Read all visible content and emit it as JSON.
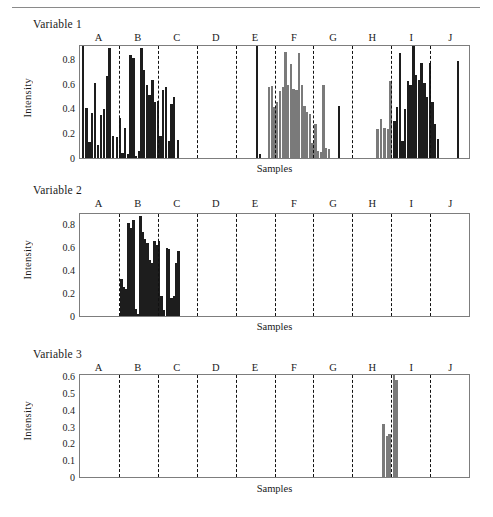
{
  "figure": {
    "title_rule": true,
    "panels": [
      {
        "title": "Variable 1"
      },
      {
        "title": "Variable 2"
      },
      {
        "title": "Variable 3"
      }
    ]
  },
  "chart_data": [
    {
      "type": "bar",
      "title": "Variable 1",
      "xlabel": "Samples",
      "ylabel": "Intensity",
      "ylim": [
        0,
        0.92
      ],
      "yticks": [
        0,
        0.2,
        0.4,
        0.6,
        0.8
      ],
      "ytick_labels": [
        "0",
        "0.2",
        "0.4",
        "0.6",
        "0.8"
      ],
      "grid": false,
      "legend": "none",
      "categories": [
        "A",
        "B",
        "C",
        "D",
        "E",
        "F",
        "G",
        "H",
        "I",
        "J"
      ],
      "group_boundaries": [
        0.1,
        0.2,
        0.3,
        0.4,
        0.5,
        0.6,
        0.7,
        0.8,
        0.9
      ],
      "bar_color_dark": "#1d1d1d",
      "bar_color_gray": "#7a7a7a",
      "bars": [
        {
          "x": 0.004,
          "h": 0.92,
          "c": "dark"
        },
        {
          "x": 0.014,
          "h": 0.41,
          "c": "dark"
        },
        {
          "x": 0.021,
          "h": 0.13,
          "c": "dark"
        },
        {
          "x": 0.028,
          "h": 0.37,
          "c": "dark"
        },
        {
          "x": 0.036,
          "h": 0.62,
          "c": "dark"
        },
        {
          "x": 0.043,
          "h": 0.11,
          "c": "dark"
        },
        {
          "x": 0.051,
          "h": 0.35,
          "c": "dark"
        },
        {
          "x": 0.058,
          "h": 0.4,
          "c": "dark"
        },
        {
          "x": 0.066,
          "h": 0.67,
          "c": "dark"
        },
        {
          "x": 0.073,
          "h": 0.9,
          "c": "dark"
        },
        {
          "x": 0.082,
          "h": 0.18,
          "c": "dark"
        },
        {
          "x": 0.092,
          "h": 0.17,
          "c": "dark"
        },
        {
          "x": 0.099,
          "h": 0.33,
          "c": "dark"
        },
        {
          "x": 0.106,
          "h": 0.04,
          "c": "dark"
        },
        {
          "x": 0.113,
          "h": 0.25,
          "c": "dark"
        },
        {
          "x": 0.12,
          "h": 0.03,
          "c": "dark"
        },
        {
          "x": 0.127,
          "h": 0.85,
          "c": "dark"
        },
        {
          "x": 0.134,
          "h": 0.82,
          "c": "dark"
        },
        {
          "x": 0.141,
          "h": 0.02,
          "c": "dark"
        },
        {
          "x": 0.148,
          "h": 0.06,
          "c": "dark"
        },
        {
          "x": 0.155,
          "h": 0.9,
          "c": "dark"
        },
        {
          "x": 0.162,
          "h": 0.72,
          "c": "dark"
        },
        {
          "x": 0.169,
          "h": 0.6,
          "c": "dark"
        },
        {
          "x": 0.176,
          "h": 0.52,
          "c": "dark"
        },
        {
          "x": 0.183,
          "h": 0.64,
          "c": "dark"
        },
        {
          "x": 0.19,
          "h": 0.46,
          "c": "dark"
        },
        {
          "x": 0.197,
          "h": 0.47,
          "c": "dark"
        },
        {
          "x": 0.204,
          "h": 0.18,
          "c": "dark"
        },
        {
          "x": 0.211,
          "h": 0.56,
          "c": "dark"
        },
        {
          "x": 0.218,
          "h": 0.58,
          "c": "dark"
        },
        {
          "x": 0.225,
          "h": 0.14,
          "c": "dark"
        },
        {
          "x": 0.232,
          "h": 0.44,
          "c": "dark"
        },
        {
          "x": 0.239,
          "h": 0.5,
          "c": "dark"
        },
        {
          "x": 0.249,
          "h": 0.15,
          "c": "dark"
        },
        {
          "x": 0.452,
          "h": 0.92,
          "c": "dark"
        },
        {
          "x": 0.459,
          "h": 0.03,
          "c": "dark"
        },
        {
          "x": 0.483,
          "h": 0.58,
          "c": "gray"
        },
        {
          "x": 0.49,
          "h": 0.59,
          "c": "gray"
        },
        {
          "x": 0.497,
          "h": 0.42,
          "c": "gray"
        },
        {
          "x": 0.504,
          "h": 0.46,
          "c": "gray"
        },
        {
          "x": 0.511,
          "h": 0.55,
          "c": "gray"
        },
        {
          "x": 0.518,
          "h": 0.58,
          "c": "gray"
        },
        {
          "x": 0.525,
          "h": 0.87,
          "c": "gray"
        },
        {
          "x": 0.532,
          "h": 0.6,
          "c": "gray"
        },
        {
          "x": 0.539,
          "h": 0.77,
          "c": "gray"
        },
        {
          "x": 0.546,
          "h": 0.57,
          "c": "gray"
        },
        {
          "x": 0.553,
          "h": 0.56,
          "c": "gray"
        },
        {
          "x": 0.56,
          "h": 0.86,
          "c": "gray"
        },
        {
          "x": 0.567,
          "h": 0.6,
          "c": "gray"
        },
        {
          "x": 0.574,
          "h": 0.43,
          "c": "gray"
        },
        {
          "x": 0.581,
          "h": 0.38,
          "c": "gray"
        },
        {
          "x": 0.588,
          "h": 0.36,
          "c": "gray"
        },
        {
          "x": 0.595,
          "h": 0.12,
          "c": "gray"
        },
        {
          "x": 0.602,
          "h": 0.28,
          "c": "gray"
        },
        {
          "x": 0.609,
          "h": 0.06,
          "c": "gray"
        },
        {
          "x": 0.616,
          "h": 0.05,
          "c": "gray"
        },
        {
          "x": 0.623,
          "h": 0.6,
          "c": "gray"
        },
        {
          "x": 0.63,
          "h": 0.08,
          "c": "gray"
        },
        {
          "x": 0.637,
          "h": 0.07,
          "c": "gray"
        },
        {
          "x": 0.663,
          "h": 0.43,
          "c": "dark"
        },
        {
          "x": 0.762,
          "h": 0.24,
          "c": "gray"
        },
        {
          "x": 0.77,
          "h": 0.32,
          "c": "gray"
        },
        {
          "x": 0.78,
          "h": 0.25,
          "c": "gray"
        },
        {
          "x": 0.788,
          "h": 0.24,
          "c": "gray"
        },
        {
          "x": 0.795,
          "h": 0.63,
          "c": "gray"
        },
        {
          "x": 0.805,
          "h": 0.3,
          "c": "dark"
        },
        {
          "x": 0.812,
          "h": 0.42,
          "c": "dark"
        },
        {
          "x": 0.819,
          "h": 0.86,
          "c": "dark"
        },
        {
          "x": 0.826,
          "h": 0.14,
          "c": "dark"
        },
        {
          "x": 0.833,
          "h": 0.4,
          "c": "dark"
        },
        {
          "x": 0.84,
          "h": 0.63,
          "c": "dark"
        },
        {
          "x": 0.847,
          "h": 0.6,
          "c": "dark"
        },
        {
          "x": 0.854,
          "h": 0.92,
          "c": "dark"
        },
        {
          "x": 0.861,
          "h": 0.68,
          "c": "dark"
        },
        {
          "x": 0.868,
          "h": 0.64,
          "c": "dark"
        },
        {
          "x": 0.875,
          "h": 0.78,
          "c": "dark"
        },
        {
          "x": 0.882,
          "h": 0.62,
          "c": "dark"
        },
        {
          "x": 0.889,
          "h": 0.5,
          "c": "dark"
        },
        {
          "x": 0.896,
          "h": 0.78,
          "c": "dark"
        },
        {
          "x": 0.903,
          "h": 0.46,
          "c": "dark"
        },
        {
          "x": 0.91,
          "h": 0.28,
          "c": "dark"
        },
        {
          "x": 0.917,
          "h": 0.16,
          "c": "dark"
        },
        {
          "x": 0.968,
          "h": 0.8,
          "c": "dark"
        },
        {
          "x": 0.968,
          "h": 0.04,
          "c": "dark"
        }
      ]
    },
    {
      "type": "bar",
      "title": "Variable 2",
      "xlabel": "Samples",
      "ylabel": "Intensity",
      "ylim": [
        0,
        0.9
      ],
      "yticks": [
        0,
        0.2,
        0.4,
        0.6,
        0.8
      ],
      "ytick_labels": [
        "0",
        "0.2",
        "0.4",
        "0.6",
        "0.8"
      ],
      "grid": false,
      "legend": "none",
      "categories": [
        "A",
        "B",
        "C",
        "D",
        "E",
        "F",
        "G",
        "H",
        "I",
        "J"
      ],
      "group_boundaries": [
        0.1,
        0.2,
        0.3,
        0.4,
        0.5,
        0.6,
        0.7,
        0.8,
        0.9
      ],
      "bar_color_dark": "#1d1d1d",
      "bar_color_gray": "#7a7a7a",
      "bars": [
        {
          "x": 0.104,
          "h": 0.33,
          "c": "dark"
        },
        {
          "x": 0.11,
          "h": 0.26,
          "c": "dark"
        },
        {
          "x": 0.116,
          "h": 0.24,
          "c": "dark"
        },
        {
          "x": 0.122,
          "h": 0.82,
          "c": "dark"
        },
        {
          "x": 0.128,
          "h": 0.78,
          "c": "dark"
        },
        {
          "x": 0.134,
          "h": 0.85,
          "c": "dark"
        },
        {
          "x": 0.14,
          "h": 0.06,
          "c": "dark"
        },
        {
          "x": 0.146,
          "h": 0.02,
          "c": "dark"
        },
        {
          "x": 0.152,
          "h": 0.88,
          "c": "dark"
        },
        {
          "x": 0.158,
          "h": 0.74,
          "c": "dark"
        },
        {
          "x": 0.164,
          "h": 0.68,
          "c": "dark"
        },
        {
          "x": 0.17,
          "h": 0.64,
          "c": "dark"
        },
        {
          "x": 0.176,
          "h": 0.49,
          "c": "dark"
        },
        {
          "x": 0.182,
          "h": 0.47,
          "c": "dark"
        },
        {
          "x": 0.188,
          "h": 0.66,
          "c": "dark"
        },
        {
          "x": 0.194,
          "h": 0.63,
          "c": "dark"
        },
        {
          "x": 0.2,
          "h": 0.66,
          "c": "dark"
        },
        {
          "x": 0.206,
          "h": 0.18,
          "c": "dark"
        },
        {
          "x": 0.212,
          "h": 0.05,
          "c": "dark"
        },
        {
          "x": 0.22,
          "h": 0.6,
          "c": "dark"
        },
        {
          "x": 0.226,
          "h": 0.59,
          "c": "dark"
        },
        {
          "x": 0.232,
          "h": 0.16,
          "c": "dark"
        },
        {
          "x": 0.238,
          "h": 0.18,
          "c": "dark"
        },
        {
          "x": 0.244,
          "h": 0.47,
          "c": "dark"
        },
        {
          "x": 0.25,
          "h": 0.57,
          "c": "dark"
        }
      ]
    },
    {
      "type": "bar",
      "title": "Variable 3",
      "xlabel": "Samples",
      "ylabel": "Intensity",
      "ylim": [
        0,
        0.62
      ],
      "yticks": [
        0,
        0.1,
        0.2,
        0.3,
        0.4,
        0.5,
        0.6
      ],
      "ytick_labels": [
        "0",
        "0.1",
        "0.2",
        "0.3",
        "0.4",
        "0.5",
        "0.6"
      ],
      "grid": false,
      "legend": "none",
      "categories": [
        "A",
        "B",
        "C",
        "D",
        "E",
        "F",
        "G",
        "H",
        "I",
        "J"
      ],
      "group_boundaries": [
        0.1,
        0.2,
        0.3,
        0.4,
        0.5,
        0.6,
        0.7,
        0.8,
        0.9
      ],
      "bar_color_dark": "#1d1d1d",
      "bar_color_gray": "#7a7a7a",
      "bars": [
        {
          "x": 0.777,
          "h": 0.32,
          "c": "gray"
        },
        {
          "x": 0.786,
          "h": 0.25,
          "c": "gray"
        },
        {
          "x": 0.793,
          "h": 0.26,
          "c": "gray"
        },
        {
          "x": 0.804,
          "h": 0.62,
          "c": "gray"
        },
        {
          "x": 0.811,
          "h": 0.59,
          "c": "gray"
        }
      ]
    }
  ]
}
